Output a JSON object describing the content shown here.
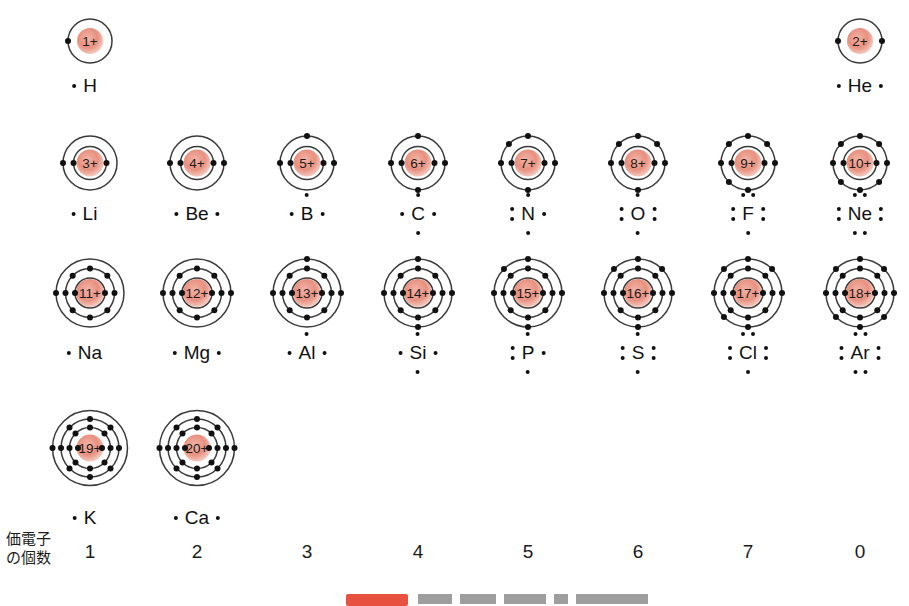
{
  "diagram": {
    "nucleus_color": "#e8907f",
    "shell_color": "#3a3a3a",
    "electron_color": "#111111",
    "valence_row_label": "価電子\nの個数",
    "valence_label_line1": "価電子",
    "valence_label_line2": "の個数",
    "valence_counts": [
      "1",
      "2",
      "3",
      "4",
      "5",
      "6",
      "7",
      "0"
    ],
    "column_centers": [
      90,
      197,
      307,
      418,
      528,
      638,
      748,
      860
    ],
    "row_centers": [
      41,
      163,
      293,
      448
    ]
  },
  "elements": [
    {
      "symbol": "H",
      "charge": "1+",
      "nucleus_label": "1+",
      "row": 0,
      "col": 0,
      "shells": [
        1
      ],
      "lewis_dots": [
        "L1"
      ],
      "label": "H",
      "cx": 90,
      "cy": 41,
      "label_y": 86
    },
    {
      "symbol": "He",
      "charge": "2+",
      "nucleus_label": "2+",
      "row": 0,
      "col": 7,
      "shells": [
        2
      ],
      "lewis_dots": [
        "L1",
        "R1"
      ],
      "label": "He",
      "cx": 860,
      "cy": 41,
      "label_y": 86
    },
    {
      "symbol": "Li",
      "charge": "3+",
      "nucleus_label": "3+",
      "row": 1,
      "col": 0,
      "shells": [
        2,
        1
      ],
      "lewis_dots": [
        "L1"
      ],
      "label": "Li",
      "cx": 90,
      "cy": 163,
      "label_y": 214
    },
    {
      "symbol": "Be",
      "charge": "4+",
      "nucleus_label": "4+",
      "row": 1,
      "col": 1,
      "shells": [
        2,
        2
      ],
      "lewis_dots": [
        "L1",
        "R1"
      ],
      "label": "Be",
      "cx": 197,
      "cy": 163,
      "label_y": 214
    },
    {
      "symbol": "B",
      "charge": "5+",
      "nucleus_label": "5+",
      "row": 1,
      "col": 2,
      "shells": [
        2,
        3
      ],
      "lewis_dots": [
        "L1",
        "R1",
        "T1"
      ],
      "label": "B",
      "cx": 307,
      "cy": 163,
      "label_y": 214
    },
    {
      "symbol": "C",
      "charge": "6+",
      "nucleus_label": "6+",
      "row": 1,
      "col": 3,
      "shells": [
        2,
        4
      ],
      "lewis_dots": [
        "L1",
        "R1",
        "T1",
        "B1"
      ],
      "label": "C",
      "cx": 418,
      "cy": 163,
      "label_y": 214
    },
    {
      "symbol": "N",
      "charge": "7+",
      "nucleus_label": "7+",
      "row": 1,
      "col": 4,
      "shells": [
        2,
        5
      ],
      "lewis_dots": [
        "L2",
        "L3",
        "R1",
        "T1",
        "B1"
      ],
      "label": "N",
      "cx": 528,
      "cy": 163,
      "label_y": 214
    },
    {
      "symbol": "O",
      "charge": "8+",
      "nucleus_label": "8+",
      "row": 1,
      "col": 5,
      "shells": [
        2,
        6
      ],
      "lewis_dots": [
        "L2",
        "L3",
        "R2",
        "R3",
        "T1",
        "B1"
      ],
      "label": "O",
      "cx": 638,
      "cy": 163,
      "label_y": 214
    },
    {
      "symbol": "F",
      "charge": "9+",
      "nucleus_label": "9+",
      "row": 1,
      "col": 6,
      "shells": [
        2,
        7
      ],
      "lewis_dots": [
        "L2",
        "L3",
        "R2",
        "R3",
        "T2",
        "T3",
        "B1"
      ],
      "label": "F",
      "cx": 748,
      "cy": 163,
      "label_y": 214
    },
    {
      "symbol": "Ne",
      "charge": "10+",
      "nucleus_label": "10+",
      "row": 1,
      "col": 7,
      "shells": [
        2,
        8
      ],
      "lewis_dots": [
        "L2",
        "L3",
        "R2",
        "R3",
        "T2",
        "T3",
        "B2",
        "B3"
      ],
      "label": "Ne",
      "cx": 860,
      "cy": 163,
      "label_y": 214
    },
    {
      "symbol": "Na",
      "charge": "11+",
      "nucleus_label": "11+",
      "row": 2,
      "col": 0,
      "shells": [
        2,
        8,
        1
      ],
      "lewis_dots": [
        "L1"
      ],
      "label": "Na",
      "cx": 90,
      "cy": 293,
      "label_y": 353
    },
    {
      "symbol": "Mg",
      "charge": "12+",
      "nucleus_label": "12+",
      "row": 2,
      "col": 1,
      "shells": [
        2,
        8,
        2
      ],
      "lewis_dots": [
        "L1",
        "R1"
      ],
      "label": "Mg",
      "cx": 197,
      "cy": 293,
      "label_y": 353
    },
    {
      "symbol": "Al",
      "charge": "13+",
      "nucleus_label": "13+",
      "row": 2,
      "col": 2,
      "shells": [
        2,
        8,
        3
      ],
      "lewis_dots": [
        "L1",
        "R1",
        "T1"
      ],
      "label": "Al",
      "cx": 307,
      "cy": 293,
      "label_y": 353
    },
    {
      "symbol": "Si",
      "charge": "14+",
      "nucleus_label": "14+",
      "row": 2,
      "col": 3,
      "shells": [
        2,
        8,
        4
      ],
      "lewis_dots": [
        "L1",
        "R1",
        "T1",
        "B1"
      ],
      "label": "Si",
      "cx": 418,
      "cy": 293,
      "label_y": 353
    },
    {
      "symbol": "P",
      "charge": "15+",
      "nucleus_label": "15+",
      "row": 2,
      "col": 4,
      "shells": [
        2,
        8,
        5
      ],
      "lewis_dots": [
        "L2",
        "L3",
        "R1",
        "T1",
        "B1"
      ],
      "label": "P",
      "cx": 528,
      "cy": 293,
      "label_y": 353
    },
    {
      "symbol": "S",
      "charge": "16+",
      "nucleus_label": "16+",
      "row": 2,
      "col": 5,
      "shells": [
        2,
        8,
        6
      ],
      "lewis_dots": [
        "L2",
        "L3",
        "R2",
        "R3",
        "T1",
        "B1"
      ],
      "label": "S",
      "cx": 638,
      "cy": 293,
      "label_y": 353
    },
    {
      "symbol": "Cl",
      "charge": "17+",
      "nucleus_label": "17+",
      "row": 2,
      "col": 6,
      "shells": [
        2,
        8,
        7
      ],
      "lewis_dots": [
        "L2",
        "L3",
        "R2",
        "R3",
        "T2",
        "T3",
        "B1"
      ],
      "label": "Cl",
      "cx": 748,
      "cy": 293,
      "label_y": 353
    },
    {
      "symbol": "Ar",
      "charge": "18+",
      "nucleus_label": "18+",
      "row": 2,
      "col": 7,
      "shells": [
        2,
        8,
        8
      ],
      "lewis_dots": [
        "L2",
        "L3",
        "R2",
        "R3",
        "T2",
        "T3",
        "B2",
        "B3"
      ],
      "label": "Ar",
      "cx": 860,
      "cy": 293,
      "label_y": 353
    },
    {
      "symbol": "K",
      "charge": "19+",
      "nucleus_label": "19+",
      "row": 3,
      "col": 0,
      "shells": [
        2,
        8,
        8,
        1
      ],
      "lewis_dots": [
        "L1"
      ],
      "label": "K",
      "cx": 90,
      "cy": 448,
      "label_y": 518
    },
    {
      "symbol": "Ca",
      "charge": "20+",
      "nucleus_label": "20+",
      "row": 3,
      "col": 1,
      "shells": [
        2,
        8,
        8,
        2
      ],
      "lewis_dots": [
        "L1",
        "R1"
      ],
      "label": "Ca",
      "cx": 197,
      "cy": 448,
      "label_y": 518
    }
  ]
}
